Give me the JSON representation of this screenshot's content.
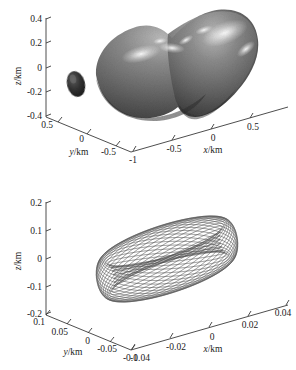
{
  "figure": {
    "background": "#ffffff",
    "ink": "#1b1b1b",
    "panels": [
      "asteroid-shape-model",
      "orbit-trajectory"
    ]
  },
  "chart_data": [
    {
      "id": "asteroid-shape-model",
      "type": "scatter",
      "render": "3d-surface",
      "title": "",
      "xlabel": "x/km",
      "ylabel": "y/km",
      "zlabel": "z/km",
      "xlim": [
        -1,
        0.75
      ],
      "ylim": [
        -0.75,
        0.75
      ],
      "zlim": [
        -0.5,
        0.5
      ],
      "xticks": [
        -1,
        -0.5,
        0,
        0.5
      ],
      "xtick_labels": [
        "-1",
        "-0.5",
        "0",
        "0.5"
      ],
      "yticks": [
        0.5,
        0,
        -0.5
      ],
      "ytick_labels": [
        "0.5",
        "0",
        "-0.5"
      ],
      "zticks": [
        0.4,
        0.2,
        0,
        -0.2,
        -0.4
      ],
      "ztick_labels": [
        "0.4",
        "0.2",
        "0",
        "-0.2",
        "-0.4"
      ],
      "grid": false,
      "legend": "none",
      "objects": [
        {
          "name": "primary-body",
          "description": "bilobed contact-binary asteroid shape model, shaded gray with specular highlights",
          "fill": "#6e6e6e",
          "highlight": "#f2f2f2",
          "shadow": "#3b3b3b"
        },
        {
          "name": "secondary-body",
          "description": "small dark ellipsoidal satellite left of the primary",
          "fill": "#2e2e2e"
        }
      ]
    },
    {
      "id": "orbit-trajectory",
      "type": "line",
      "render": "3d-trajectory",
      "title": "",
      "xlabel": "x/km",
      "ylabel": "y/km",
      "zlabel": "z/km",
      "xlim": [
        -0.04,
        0.04
      ],
      "ylim": [
        -0.1,
        0.1
      ],
      "zlim": [
        -0.2,
        0.2
      ],
      "xticks": [
        -0.04,
        -0.02,
        0,
        0.02,
        0.04
      ],
      "xtick_labels": [
        "-0.04",
        "-0.02",
        "0",
        "0.02",
        "0.04"
      ],
      "yticks": [
        0.1,
        0.05,
        0,
        -0.05,
        -0.1
      ],
      "ytick_labels": [
        "0.1",
        "0.05",
        "0",
        "-0.05",
        "-0.1"
      ],
      "zticks": [
        0.2,
        0.1,
        0,
        -0.1,
        -0.2
      ],
      "ztick_labels": [
        "0.2",
        "0.1",
        "0",
        "-0.1",
        "-0.2"
      ],
      "grid": false,
      "legend": "none",
      "series": [
        {
          "name": "precessing-orbit",
          "description": "dense quasi-periodic precessing orbit forming a hyperboloid-like tube envelope with a narrow waist",
          "color": "#4a4a4a",
          "revolutions": 60,
          "linewidth": 0.35
        }
      ]
    }
  ]
}
